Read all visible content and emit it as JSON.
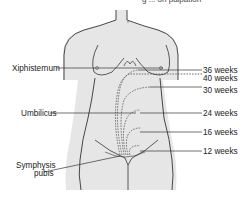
{
  "figure": {
    "caption_fragment": "g ... on palpation",
    "body_fill": "#e6e6e6",
    "outline_color": "#333333",
    "leader_color": "#333333"
  },
  "labels_left": {
    "xiphisternum": "Xiphisternum",
    "umbilicus": "Umbilicus",
    "symphysis_line1": "Symphysis",
    "symphysis_line2": "pubis"
  },
  "labels_right": {
    "w36": "36 weeks",
    "w40": "40 weeks",
    "w30": "30 weeks",
    "w24": "24 weeks",
    "w16": "16 weeks",
    "w12": "12 weeks"
  }
}
